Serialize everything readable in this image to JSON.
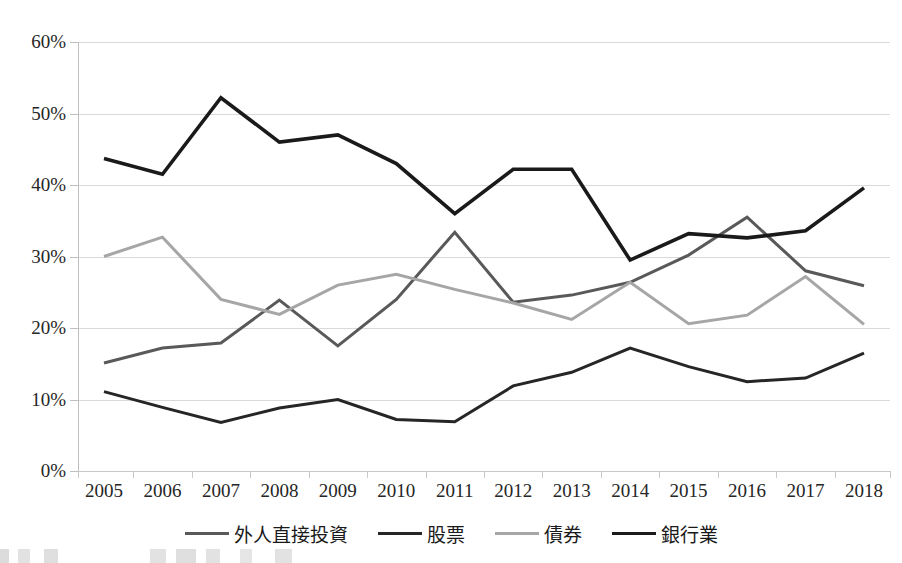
{
  "chart_data": {
    "type": "line",
    "title": "",
    "xlabel": "",
    "ylabel": "",
    "categories": [
      "2005",
      "2006",
      "2007",
      "2008",
      "2009",
      "2010",
      "2011",
      "2012",
      "2013",
      "2014",
      "2015",
      "2016",
      "2017",
      "2018"
    ],
    "ylim": [
      0,
      60
    ],
    "y_ticks": [
      0,
      10,
      20,
      30,
      40,
      50,
      60
    ],
    "y_tick_labels": [
      "0%",
      "10%",
      "20%",
      "30%",
      "40%",
      "50%",
      "60%"
    ],
    "y_axis_format": "percent",
    "grid": "horizontal",
    "legend_position": "bottom",
    "series": [
      {
        "name": "外人直接投資",
        "color": "#595959",
        "stroke_width": 3,
        "values": [
          15.1,
          17.2,
          17.9,
          23.9,
          17.5,
          24.0,
          33.4,
          23.6,
          24.6,
          26.4,
          30.2,
          35.5,
          28.0,
          25.9
        ]
      },
      {
        "name": "股票",
        "color": "#262626",
        "stroke_width": 3,
        "values": [
          11.1,
          8.9,
          6.8,
          8.8,
          10.0,
          7.2,
          6.9,
          11.9,
          13.8,
          17.2,
          14.6,
          12.5,
          13.0,
          16.5
        ]
      },
      {
        "name": "債券",
        "color": "#a6a6a6",
        "stroke_width": 3,
        "values": [
          30.0,
          32.7,
          24.0,
          21.9,
          26.0,
          27.5,
          25.4,
          23.5,
          21.2,
          26.4,
          20.6,
          21.8,
          27.2,
          20.5
        ]
      },
      {
        "name": "銀行業",
        "color": "#1a1a1a",
        "stroke_width": 3.6,
        "values": [
          43.7,
          41.5,
          52.2,
          46.0,
          47.0,
          43.0,
          36.0,
          42.2,
          42.2,
          29.5,
          33.2,
          32.6,
          33.6,
          39.6
        ]
      }
    ]
  },
  "legend": {
    "items": [
      {
        "label": "外人直接投資",
        "color": "#595959",
        "width": 3
      },
      {
        "label": "股票",
        "color": "#262626",
        "width": 3
      },
      {
        "label": "債券",
        "color": "#a6a6a6",
        "width": 3
      },
      {
        "label": "銀行業",
        "color": "#1a1a1a",
        "width": 3.6
      }
    ]
  },
  "axes": {
    "y_labels": [
      "60%",
      "50%",
      "40%",
      "30%",
      "20%",
      "10%",
      "0%"
    ],
    "x_labels": [
      "2005",
      "2006",
      "2007",
      "2008",
      "2009",
      "2010",
      "2011",
      "2012",
      "2013",
      "2014",
      "2015",
      "2016",
      "2017",
      "2018"
    ]
  },
  "colors": {
    "gridline": "#d9d9d9",
    "axis": "#bfbfbf",
    "text": "#262626",
    "background": "#ffffff"
  }
}
